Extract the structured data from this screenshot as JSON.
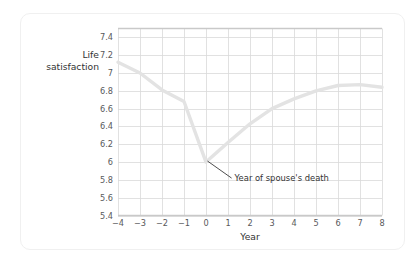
{
  "chart_data": {
    "type": "line",
    "title": "",
    "xlabel": "Year",
    "ylabel": "Life satisfaction",
    "ylabel_lines": [
      "Life",
      "satisfaction"
    ],
    "xlim": [
      -4,
      8
    ],
    "ylim": [
      5.4,
      7.5
    ],
    "grid": true,
    "legend": "none",
    "x_ticks": [
      "−4",
      "−3",
      "−2",
      "−1",
      "0",
      "1",
      "2",
      "3",
      "4",
      "5",
      "6",
      "7",
      "8"
    ],
    "x_tick_values": [
      -4,
      -3,
      -2,
      -1,
      0,
      1,
      2,
      3,
      4,
      5,
      6,
      7,
      8
    ],
    "y_ticks": [
      "5.4",
      "5.6",
      "5.8",
      "6",
      "6.2",
      "6.4",
      "6.6",
      "6.8",
      "7",
      "7.2",
      "7.4"
    ],
    "y_tick_values": [
      5.4,
      5.6,
      5.8,
      6.0,
      6.2,
      6.4,
      6.6,
      6.8,
      7.0,
      7.2,
      7.4
    ],
    "series": [
      {
        "name": "Life satisfaction",
        "color": "#e3e3e3",
        "x": [
          -4,
          -3,
          -2,
          -1,
          0,
          1,
          2,
          3,
          4,
          5,
          6,
          7,
          8
        ],
        "values": [
          7.12,
          7.0,
          6.81,
          6.68,
          6.0,
          6.22,
          6.43,
          6.6,
          6.71,
          6.8,
          6.86,
          6.87,
          6.84
        ]
      }
    ],
    "annotations": [
      {
        "text": "Year of spouse's death",
        "point_x": 0,
        "point_y": 6.0,
        "label_x": 1.3,
        "label_y": 5.82
      }
    ]
  },
  "style": {
    "grid_color": "#d9d9d9",
    "axis_color": "#bdbdbd",
    "top_rule_color": "#c9c9c9",
    "line_color": "#e3e3e3",
    "text_color": "#333333",
    "tick_text_color": "#58595b",
    "card_border_color": "#f0f0f0",
    "background": "#ffffff"
  }
}
